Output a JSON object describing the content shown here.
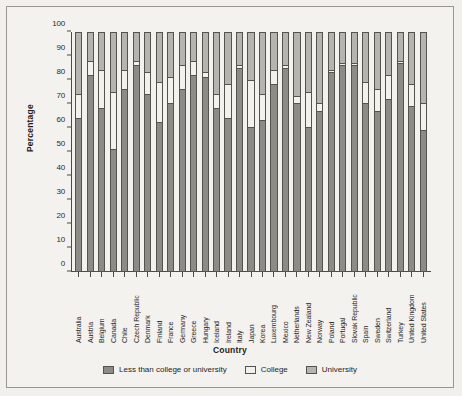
{
  "figure": {
    "background_color": "#f4f2ee",
    "border_color": "#9a968e"
  },
  "chart_data": {
    "type": "bar",
    "subtype": "stacked-bar-100pct",
    "title": "",
    "xlabel": "Country",
    "ylabel": "Percentage",
    "ylim": [
      0,
      100
    ],
    "yticks": [
      0,
      10,
      20,
      30,
      40,
      50,
      60,
      70,
      80,
      90,
      100
    ],
    "grid": false,
    "legend_position": "bottom-center",
    "stack_order_bottom_to_top": [
      "Less than college or university",
      "College",
      "University"
    ],
    "colors": {
      "Less than college or university": "#8d8b85",
      "College": "#f3f1ec",
      "University": "#b6b4ae"
    },
    "categories": [
      "Australia",
      "Austria",
      "Belgium",
      "Canada",
      "Chile",
      "Czech Republic",
      "Denmark",
      "Finland",
      "France",
      "Germany",
      "Greece",
      "Hungary",
      "Iceland",
      "Ireland",
      "Italy",
      "Japan",
      "Korea",
      "Luxembourg",
      "Mexico",
      "Netherlands",
      "New Zealand",
      "Norway",
      "Poland",
      "Portugal",
      "Slovak Republic",
      "Spain",
      "Sweden",
      "Switzerland",
      "Turkey",
      "United Kingdom",
      "United States"
    ],
    "series": [
      {
        "name": "Less than college or university",
        "values": [
          64,
          82,
          68,
          51,
          76,
          86,
          74,
          62,
          70,
          76,
          82,
          81,
          68,
          64,
          85,
          60,
          63,
          78,
          85,
          70,
          60,
          67,
          83,
          86,
          86,
          70,
          67,
          72,
          87,
          69,
          59
        ]
      },
      {
        "name": "College",
        "values": [
          10,
          6,
          16,
          24,
          8,
          2,
          9,
          17,
          11,
          10,
          6,
          2,
          6,
          14,
          1,
          20,
          11,
          6,
          1,
          3,
          15,
          3,
          1,
          1,
          1,
          9,
          9,
          10,
          1,
          9,
          11
        ]
      },
      {
        "name": "University",
        "values": [
          26,
          12,
          16,
          25,
          16,
          12,
          17,
          21,
          19,
          14,
          12,
          17,
          26,
          22,
          14,
          20,
          26,
          16,
          14,
          27,
          25,
          30,
          16,
          13,
          13,
          21,
          24,
          18,
          12,
          22,
          30
        ]
      }
    ]
  },
  "legend": {
    "items": [
      {
        "label": "Less than college or university",
        "color": "#8d8b85"
      },
      {
        "label": "College",
        "color": "#f3f1ec"
      },
      {
        "label": "University",
        "color": "#b6b4ae"
      }
    ]
  }
}
